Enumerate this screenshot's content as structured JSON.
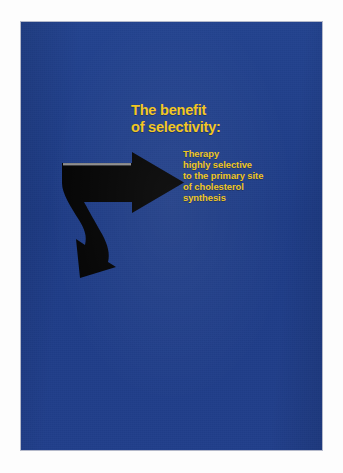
{
  "poster": {
    "background_color": "#1f3f8c",
    "headline": {
      "color": "#f3c61b",
      "lines": [
        "The benefit",
        "of selectivity:"
      ]
    },
    "body": {
      "color": "#f0c518",
      "lines": [
        "Therapy",
        "highly selective",
        "to the primary site",
        "of cholesterol",
        "synthesis"
      ]
    },
    "graphic": {
      "name": "curved-right-arrow",
      "color": "#050505",
      "highlight_color": "#c9c9c9",
      "description": "Thick black arrow pointing right with a curving tail that hooks down and back to the lower left into a second arrowhead"
    }
  }
}
